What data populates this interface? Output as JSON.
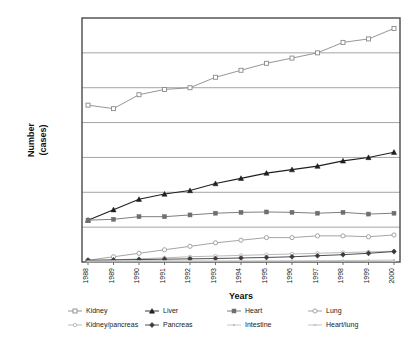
{
  "chart_data": {
    "type": "line",
    "title": "",
    "xlabel": "Years",
    "ylabel": "Number\n(cases)",
    "ylabel_line1": "Number",
    "ylabel_line2": "(cases)",
    "categories": [
      "1988",
      "1989",
      "1990",
      "1991",
      "1992",
      "1993",
      "1994",
      "1995",
      "1996",
      "1997",
      "1998",
      "1999",
      "2000"
    ],
    "x": [
      1988,
      1989,
      1990,
      1991,
      1992,
      1993,
      1994,
      1995,
      1996,
      1997,
      1998,
      1999,
      2000
    ],
    "ylim": [
      0,
      14000
    ],
    "yticks": [
      0,
      2000,
      4000,
      6000,
      8000,
      10000,
      12000,
      14000
    ],
    "y_tick_labels_shown": false,
    "grid": true,
    "grid_axis": "y",
    "legend_position": "bottom",
    "legend_columns": 4,
    "series": [
      {
        "name": "Kidney",
        "marker": "square-open",
        "color": "#8a8a8a",
        "values": [
          9000,
          8800,
          9600,
          9900,
          10000,
          10600,
          11000,
          11400,
          11700,
          12000,
          12600,
          12800,
          13400
        ]
      },
      {
        "name": "Liver",
        "marker": "triangle-filled",
        "color": "#1f1f1f",
        "values": [
          2400,
          3000,
          3600,
          3900,
          4100,
          4500,
          4800,
          5100,
          5300,
          5500,
          5800,
          6000,
          6300
        ]
      },
      {
        "name": "Heart",
        "marker": "square-filled",
        "color": "#6f6f6f",
        "values": [
          2400,
          2450,
          2600,
          2600,
          2700,
          2800,
          2850,
          2870,
          2850,
          2800,
          2850,
          2750,
          2800
        ]
      },
      {
        "name": "Lung",
        "marker": "circle-open",
        "color": "#9a9a9a",
        "values": [
          100,
          300,
          500,
          700,
          900,
          1100,
          1250,
          1400,
          1400,
          1500,
          1500,
          1450,
          1550
        ]
      },
      {
        "name": "Kidney/pancreas",
        "marker": "dot",
        "color": "#b0b0b0",
        "values": [
          60,
          120,
          180,
          240,
          300,
          340,
          380,
          420,
          460,
          500,
          540,
          580,
          620
        ]
      },
      {
        "name": "Pancreas",
        "marker": "diamond-filled",
        "color": "#3a3a3a",
        "values": [
          100,
          120,
          140,
          160,
          180,
          200,
          230,
          260,
          300,
          360,
          420,
          500,
          600
        ]
      },
      {
        "name": "Intestine",
        "marker": "tiny",
        "color": "#c0c0c0",
        "values": [
          10,
          15,
          20,
          25,
          30,
          35,
          45,
          55,
          65,
          75,
          85,
          95,
          110
        ]
      },
      {
        "name": "Heart/lung",
        "marker": "dash",
        "color": "#bdbdbd",
        "values": [
          60,
          70,
          70,
          70,
          60,
          60,
          55,
          50,
          50,
          45,
          45,
          40,
          40
        ]
      }
    ]
  },
  "legend": {
    "row1": [
      "Kidney",
      "Liver",
      "Heart",
      "Lung"
    ],
    "row2": [
      "Kidney/pancreas",
      "Pancreas",
      "Intestine",
      "Heart/lung"
    ]
  }
}
